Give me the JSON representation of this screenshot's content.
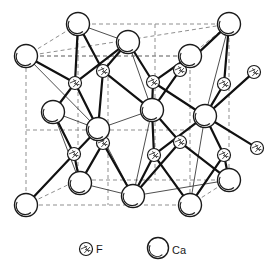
{
  "figure": {
    "background_color": "#ffffff",
    "line_color": "#1a1a1a",
    "dashed_color": "#8a8a8a",
    "bond_color": "#111111",
    "fill_color": "#ffffff"
  },
  "legend": {
    "items": [
      {
        "symbol": "f-atom",
        "label": "F"
      },
      {
        "symbol": "ca-atom",
        "label": "Ca"
      }
    ],
    "f_label": "F",
    "ca_label": "Ca",
    "f_marker_x": 86,
    "f_marker_y": 249,
    "f_marker_r": 6.5,
    "f_text_x": 96,
    "f_text_y": 253,
    "ca_marker_x": 158,
    "ca_marker_y": 248,
    "ca_marker_r": 10.5,
    "ca_text_x": 172,
    "ca_text_y": 254
  },
  "cube": {
    "description": "dashed parallelepiped outline of the unit cell",
    "front_face": [
      {
        "x": 26,
        "y": 56
      },
      {
        "x": 190,
        "y": 56
      },
      {
        "x": 190,
        "y": 205
      },
      {
        "x": 26,
        "y": 205
      }
    ],
    "back_face": [
      {
        "x": 78,
        "y": 24
      },
      {
        "x": 229,
        "y": 24
      },
      {
        "x": 229,
        "y": 180
      },
      {
        "x": 78,
        "y": 180
      }
    ],
    "mid_vertical_x_front": 108,
    "mid_vertical_x_back": 155,
    "mid_horizontal_y": 130
  },
  "atoms": {
    "ca_radius": 11.5,
    "f_radius": 6.5,
    "ca": [
      {
        "id": "ca-back-top-left",
        "x": 78,
        "y": 24
      },
      {
        "id": "ca-back-top-right",
        "x": 229,
        "y": 24
      },
      {
        "id": "ca-front-top-left",
        "x": 26,
        "y": 56
      },
      {
        "id": "ca-front-top-right",
        "x": 190,
        "y": 56
      },
      {
        "id": "ca-top-face-center",
        "x": 128,
        "y": 42
      },
      {
        "id": "ca-left-face-center",
        "x": 53,
        "y": 112
      },
      {
        "id": "ca-front-face-center",
        "x": 98,
        "y": 129
      },
      {
        "id": "ca-body-center-upper",
        "x": 152,
        "y": 110
      },
      {
        "id": "ca-right-face-center",
        "x": 205,
        "y": 116
      },
      {
        "id": "ca-front-bottom-left",
        "x": 26,
        "y": 205
      },
      {
        "id": "ca-front-bottom-mid",
        "x": 80,
        "y": 183
      },
      {
        "id": "ca-bottom-face-center",
        "x": 133,
        "y": 196
      },
      {
        "id": "ca-front-bottom-right",
        "x": 190,
        "y": 205
      },
      {
        "id": "ca-back-bottom-right",
        "x": 229,
        "y": 180
      }
    ],
    "f": [
      {
        "id": "f-upper-left-inner",
        "x": 75,
        "y": 83
      },
      {
        "id": "f-upper-midleft",
        "x": 103,
        "y": 71
      },
      {
        "id": "f-upper-mid",
        "x": 153,
        "y": 82
      },
      {
        "id": "f-upper-midright",
        "x": 180,
        "y": 70
      },
      {
        "id": "f-upper-right-inner",
        "x": 224,
        "y": 84
      },
      {
        "id": "f-external-upper",
        "x": 254,
        "y": 72
      },
      {
        "id": "f-lower-left-inner",
        "x": 74,
        "y": 154
      },
      {
        "id": "f-lower-midleft",
        "x": 103,
        "y": 143
      },
      {
        "id": "f-lower-mid",
        "x": 154,
        "y": 155
      },
      {
        "id": "f-lower-midright",
        "x": 180,
        "y": 142
      },
      {
        "id": "f-lower-right-inner",
        "x": 224,
        "y": 155
      },
      {
        "id": "f-external-lower",
        "x": 257,
        "y": 148
      }
    ]
  },
  "bonds": {
    "description": "Ca-F coordination bonds drawn as solid lines",
    "list": [
      [
        "ca-front-top-left",
        "f-upper-left-inner"
      ],
      [
        "ca-back-top-left",
        "f-upper-left-inner"
      ],
      [
        "ca-back-top-left",
        "f-upper-midleft"
      ],
      [
        "ca-top-face-center",
        "f-upper-midleft"
      ],
      [
        "ca-top-face-center",
        "f-upper-left-inner"
      ],
      [
        "ca-top-face-center",
        "f-upper-mid"
      ],
      [
        "ca-front-top-right",
        "f-upper-mid"
      ],
      [
        "ca-front-top-right",
        "f-upper-midright"
      ],
      [
        "ca-back-top-right",
        "f-upper-midright"
      ],
      [
        "ca-back-top-right",
        "f-upper-right-inner"
      ],
      [
        "ca-right-face-center",
        "f-upper-right-inner"
      ],
      [
        "ca-right-face-center",
        "f-external-upper"
      ],
      [
        "ca-left-face-center",
        "f-upper-left-inner"
      ],
      [
        "ca-front-face-center",
        "f-upper-left-inner"
      ],
      [
        "ca-front-face-center",
        "f-upper-midleft"
      ],
      [
        "ca-body-center-upper",
        "f-upper-midleft"
      ],
      [
        "ca-body-center-upper",
        "f-upper-mid"
      ],
      [
        "ca-body-center-upper",
        "f-upper-midright"
      ],
      [
        "ca-right-face-center",
        "f-upper-mid"
      ],
      [
        "ca-left-face-center",
        "f-lower-left-inner"
      ],
      [
        "ca-front-face-center",
        "f-lower-left-inner"
      ],
      [
        "ca-front-face-center",
        "f-lower-midleft"
      ],
      [
        "ca-body-center-upper",
        "f-lower-mid"
      ],
      [
        "ca-body-center-upper",
        "f-lower-midright"
      ],
      [
        "ca-right-face-center",
        "f-lower-right-inner"
      ],
      [
        "ca-right-face-center",
        "f-external-lower"
      ],
      [
        "ca-right-face-center",
        "f-lower-mid"
      ],
      [
        "ca-front-bottom-left",
        "f-lower-left-inner"
      ],
      [
        "ca-front-bottom-mid",
        "f-lower-left-inner"
      ],
      [
        "ca-front-bottom-mid",
        "f-lower-midleft"
      ],
      [
        "ca-bottom-face-center",
        "f-lower-midleft"
      ],
      [
        "ca-bottom-face-center",
        "f-lower-mid"
      ],
      [
        "ca-front-bottom-right",
        "f-lower-mid"
      ],
      [
        "ca-front-bottom-right",
        "f-lower-right-inner"
      ],
      [
        "ca-back-bottom-right",
        "f-lower-right-inner"
      ],
      [
        "ca-back-bottom-right",
        "f-lower-midright"
      ],
      [
        "ca-bottom-face-center",
        "f-lower-midright"
      ]
    ],
    "thin_list": [
      [
        "ca-front-top-left",
        "ca-front-face-center"
      ],
      [
        "ca-back-top-left",
        "ca-top-face-center"
      ],
      [
        "ca-top-face-center",
        "ca-body-center-upper"
      ],
      [
        "ca-front-top-right",
        "ca-body-center-upper"
      ],
      [
        "ca-back-top-right",
        "ca-right-face-center"
      ],
      [
        "ca-left-face-center",
        "ca-front-bottom-mid"
      ],
      [
        "ca-front-face-center",
        "ca-bottom-face-center"
      ],
      [
        "ca-body-center-upper",
        "ca-bottom-face-center"
      ],
      [
        "ca-front-face-center",
        "ca-body-center-upper"
      ],
      [
        "ca-left-face-center",
        "ca-front-face-center"
      ],
      [
        "ca-right-face-center",
        "ca-front-bottom-right"
      ],
      [
        "ca-front-bottom-mid",
        "ca-bottom-face-center"
      ],
      [
        "ca-bottom-face-center",
        "ca-back-bottom-right"
      ]
    ]
  }
}
